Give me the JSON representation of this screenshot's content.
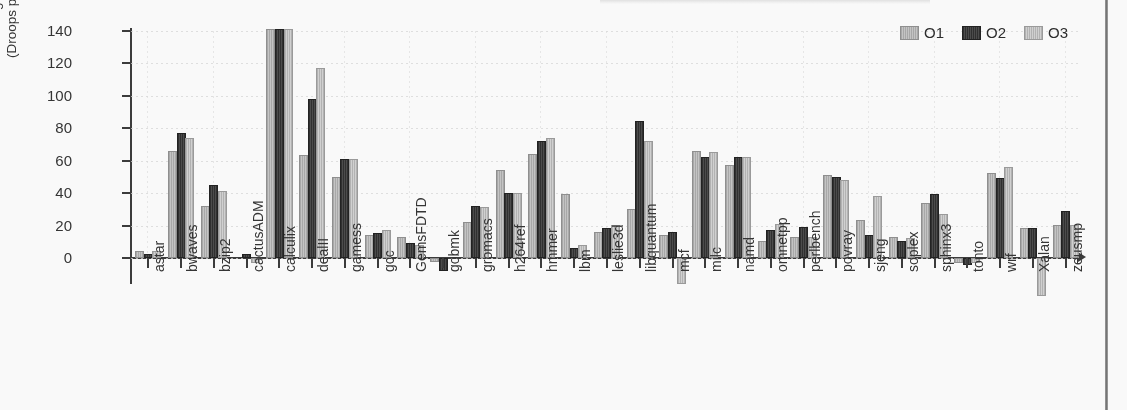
{
  "figure": {
    "legend": [
      {
        "label": "O1",
        "key": "O1",
        "color": "#bdbdbd"
      },
      {
        "label": "O2",
        "key": "O2",
        "color": "#333333"
      },
      {
        "label": "O3",
        "key": "O3",
        "color": "#cfcfcf"
      }
    ],
    "page_edge": "scan-page-border"
  },
  "chart_data": {
    "type": "bar",
    "title": "",
    "xlabel": "",
    "ylabel": "% Change from O0\n(Droops per 1K Cycles)",
    "ylabel_line1": "% Change from O0",
    "ylabel_line2": "(Droops per 1K Cycles)",
    "ylim": [
      -25,
      140
    ],
    "yticks": [
      0,
      20,
      40,
      60,
      80,
      100,
      120,
      140
    ],
    "ytick_labels": [
      "0",
      "20",
      "40",
      "60",
      "80",
      "100",
      "120",
      "140"
    ],
    "grid": true,
    "legend_position": "top-right",
    "clipped_note": "calculix bars clipped at top of axis (>=140)",
    "categories": [
      "astar",
      "bwaves",
      "bzip2",
      "cactusADM",
      "calculix",
      "dealII",
      "gamess",
      "gcc",
      "GemsFDTD",
      "gobmk",
      "gromacs",
      "h264ref",
      "hmmer",
      "lbm",
      "leslie3d",
      "libquantum",
      "mcf",
      "milc",
      "namd",
      "omnetpp",
      "perlbench",
      "povray",
      "sjeng",
      "soplex",
      "sphinx3",
      "tonto",
      "wrf",
      "Xalan",
      "zeusmp"
    ],
    "series": [
      {
        "name": "O1",
        "values": [
          3,
          65,
          31,
          0,
          141,
          62,
          49,
          13,
          12,
          -1,
          21,
          53,
          63,
          38,
          15,
          29,
          13,
          65,
          56,
          9,
          12,
          50,
          22,
          12,
          33,
          -2,
          51,
          17,
          19
        ]
      },
      {
        "name": "O2",
        "values": [
          1,
          76,
          44,
          1,
          141,
          97,
          60,
          14,
          8,
          -7,
          31,
          39,
          71,
          5,
          17,
          83,
          15,
          61,
          61,
          16,
          18,
          49,
          13,
          9,
          38,
          -3,
          48,
          17,
          28
        ]
      },
      {
        "name": "O3",
        "values": [
          3,
          73,
          40,
          -2,
          141,
          116,
          60,
          16,
          7,
          0,
          30,
          39,
          73,
          7,
          19,
          71,
          -15,
          64,
          61,
          20,
          12,
          47,
          37,
          11,
          26,
          -2,
          55,
          -22,
          19
        ]
      }
    ]
  }
}
